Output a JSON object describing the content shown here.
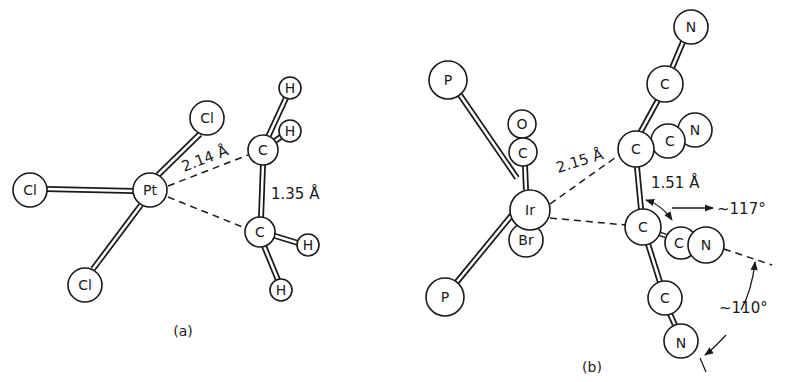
{
  "panels": [
    {
      "id": "a",
      "caption": "(a)",
      "distance_labels": {
        "pt_c": "2.14 Å",
        "c_c": "1.35 Å"
      },
      "atoms": {
        "pt": "Pt",
        "cl_left": "Cl",
        "cl_top": "Cl",
        "cl_bottom": "Cl",
        "c_top": "C",
        "c_bottom": "C",
        "h1": "H",
        "h2": "H",
        "h3": "H",
        "h4": "H"
      }
    },
    {
      "id": "b",
      "caption": "(b)",
      "distance_labels": {
        "ir_c": "2.15 Å",
        "c_c": "1.51 Å"
      },
      "angle_labels": {
        "angle1": "~117°",
        "angle2": "~110°"
      },
      "atoms": {
        "ir": "Ir",
        "p_top": "P",
        "p_bottom": "P",
        "o": "O",
        "c_co": "C",
        "br": "Br",
        "c_upper": "C",
        "c_lower": "C",
        "c_cn_top": "C",
        "n_top": "N",
        "c_cn_upper_right": "C",
        "n_upper_right": "N",
        "c_cn_lower_right": "C",
        "n_lower_right": "N",
        "c_cn_bottom": "C",
        "n_bottom": "N"
      }
    }
  ]
}
